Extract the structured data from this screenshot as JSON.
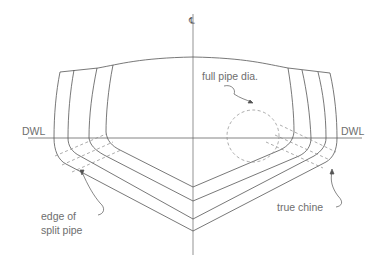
{
  "diagram": {
    "labels": {
      "centerline": "℄",
      "dwl_left": "DWL",
      "dwl_right": "DWL",
      "full_pipe": "full pipe dia.",
      "edge_split_line1": "edge of",
      "edge_split_line2": "split pipe",
      "true_chine": "true chine"
    },
    "colors": {
      "line": "#555555",
      "dashed": "#888888",
      "text": "#6e6e6e",
      "background": "#ffffff"
    }
  }
}
